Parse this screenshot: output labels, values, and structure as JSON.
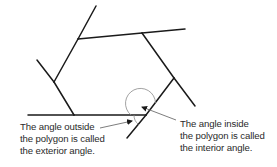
{
  "diagram": {
    "colors": {
      "line": "#1a1a1a",
      "arrow": "#6e6e6e",
      "arc": "#8a8a8a",
      "text": "#2a2a2a",
      "background": "#ffffff"
    },
    "polygon_vertices": [
      [
        78,
        39
      ],
      [
        142,
        33
      ],
      [
        174,
        78
      ],
      [
        146,
        115
      ],
      [
        74,
        115
      ],
      [
        54,
        82
      ]
    ],
    "extended_lines": [
      {
        "from": [
          96,
          6
        ],
        "to": [
          78,
          39
        ]
      },
      {
        "from": [
          142,
          33
        ],
        "to": [
          185,
          29
        ]
      },
      {
        "from": [
          174,
          78
        ],
        "to": [
          195,
          106
        ]
      },
      {
        "from": [
          146,
          115
        ],
        "to": [
          127,
          138
        ]
      },
      {
        "from": [
          28,
          115
        ],
        "to": [
          74,
          115
        ]
      },
      {
        "from": [
          37,
          60
        ],
        "to": [
          54,
          82
        ]
      }
    ],
    "exterior_caption": {
      "lines": [
        "The angle outside",
        "the polygon is called",
        "the exterior angle."
      ]
    },
    "interior_caption": {
      "lines": [
        "The angle inside",
        "the polygon is called",
        "the interior angle."
      ]
    }
  }
}
